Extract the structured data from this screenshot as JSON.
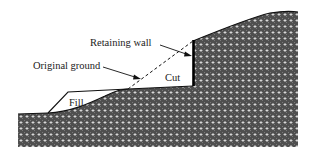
{
  "diagram": {
    "labels": {
      "retaining_wall": "Retaining wall",
      "original_ground": "Original ground",
      "cut": "Cut",
      "fill": "Fill"
    },
    "colors": {
      "ground_fill": "#4a4a4a",
      "ground_dots": "#ffffff",
      "line": "#111111",
      "background": "#ffffff"
    }
  }
}
